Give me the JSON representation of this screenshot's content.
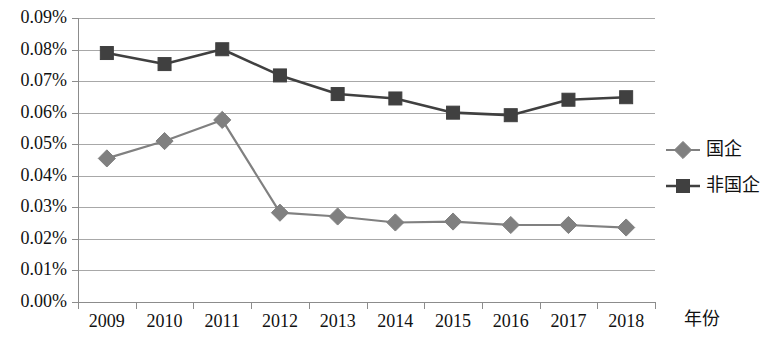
{
  "chart_data": {
    "type": "line",
    "title": "",
    "subtitle": "",
    "xlabel": "年份",
    "ylabel": "",
    "categories": [
      "2009",
      "2010",
      "2011",
      "2012",
      "2013",
      "2014",
      "2015",
      "2016",
      "2017",
      "2018"
    ],
    "ylim": [
      0.0,
      0.09
    ],
    "ytick_labels": [
      "0.09%",
      "0.08%",
      "0.07%",
      "0.06%",
      "0.05%",
      "0.04%",
      "0.03%",
      "0.02%",
      "0.01%",
      "0.00%"
    ],
    "ytick_values": [
      0.09,
      0.08,
      0.07,
      0.06,
      0.05,
      0.04,
      0.03,
      0.02,
      0.01,
      0.0
    ],
    "grid": true,
    "legend_position": "right",
    "series": [
      {
        "name": "国企",
        "marker": "diamond",
        "color": "#808080",
        "values": [
          0.0455,
          0.051,
          0.0577,
          0.0283,
          0.0271,
          0.0252,
          0.0255,
          0.0244,
          0.0244,
          0.0236
        ]
      },
      {
        "name": "非国企",
        "marker": "square",
        "color": "#404040",
        "values": [
          0.0789,
          0.0754,
          0.0801,
          0.0718,
          0.0659,
          0.0645,
          0.06,
          0.0592,
          0.0641,
          0.0649
        ]
      }
    ]
  },
  "legend": {
    "items": [
      {
        "label": "国企"
      },
      {
        "label": "非国企"
      }
    ]
  },
  "axes": {
    "x_axis_title": "年份"
  }
}
